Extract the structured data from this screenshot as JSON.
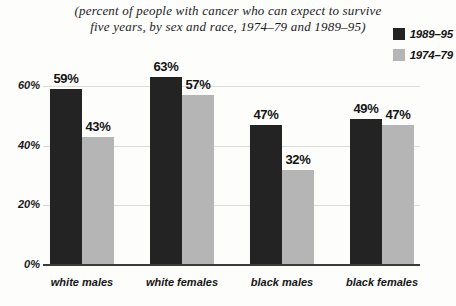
{
  "title": {
    "line1": "(percent of people with cancer who can expect to survive",
    "line2": "five years, by sex and race, 1974–79 and 1989–95)"
  },
  "legend": {
    "items": [
      {
        "label": "1989–95",
        "color": "#232323"
      },
      {
        "label": "1974–79",
        "color": "#b5b5b5"
      }
    ]
  },
  "chart_data": {
    "type": "bar",
    "title": "(percent of people with cancer who can expect to survive five years, by sex and race, 1974–79 and 1989–95)",
    "categories": [
      "white males",
      "white females",
      "black males",
      "black females"
    ],
    "series": [
      {
        "name": "1989–95",
        "color": "#232323",
        "values": [
          59,
          63,
          47,
          49
        ]
      },
      {
        "name": "1974–79",
        "color": "#b5b5b5",
        "values": [
          43,
          57,
          32,
          47
        ]
      }
    ],
    "value_label_suffix": "%",
    "yticks": [
      {
        "value": 0,
        "label": "0%"
      },
      {
        "value": 20,
        "label": "20%"
      },
      {
        "value": 40,
        "label": "40%"
      },
      {
        "value": 60,
        "label": "60%"
      }
    ],
    "ylim": [
      0,
      60
    ],
    "grid": true,
    "legend_position": "top-right",
    "xlabel": "",
    "ylabel": ""
  },
  "colors": {
    "background": "#fdfdfc",
    "gridline": "#dcdcda",
    "axis": "#3b3b3b",
    "text": "#141414"
  }
}
